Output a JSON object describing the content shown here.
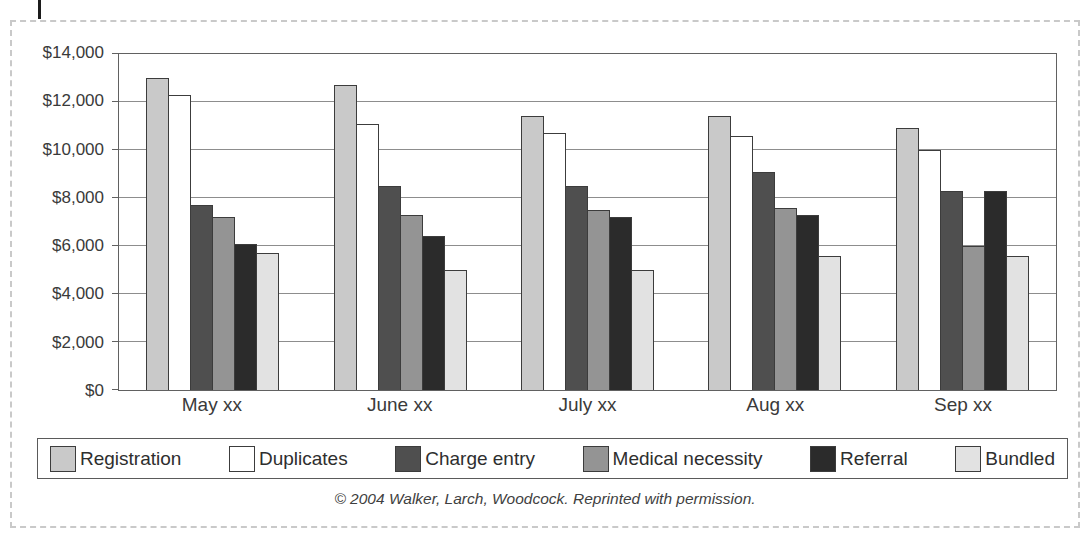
{
  "figure": {
    "caption": "© 2004 Walker, Larch, Woodcock. Reprinted with permission."
  },
  "colors": {
    "panel_border": "#c9c9c9",
    "plot_border": "#616161",
    "gridline": "#8d8d8d",
    "bar_border": "#3c3c3c",
    "text": "#3a3a3a",
    "page_mark": "#1c1c1c"
  },
  "chart_data": {
    "type": "bar",
    "title": "",
    "xlabel": "",
    "ylabel": "",
    "grid": true,
    "legend_position": "bottom",
    "ylim": [
      0,
      14000
    ],
    "ytick_step": 2000,
    "ytick_labels": [
      "$0",
      "$2,000",
      "$4,000",
      "$6,000",
      "$8,000",
      "$10,000",
      "$12,000",
      "$14,000"
    ],
    "categories": [
      "May xx",
      "June xx",
      "July xx",
      "Aug xx",
      "Sep xx"
    ],
    "series": [
      {
        "name": "Registration",
        "color": "#c9c9c9",
        "values": [
          13000,
          12700,
          11400,
          11400,
          10900
        ]
      },
      {
        "name": "Duplicates",
        "color": "#ffffff",
        "values": [
          12300,
          11100,
          10700,
          10600,
          10000
        ]
      },
      {
        "name": "Charge entry",
        "color": "#4f4f4f",
        "values": [
          7700,
          8500,
          8500,
          9100,
          8300
        ]
      },
      {
        "name": "Medical necessity",
        "color": "#949494",
        "values": [
          7200,
          7300,
          7500,
          7600,
          6000
        ]
      },
      {
        "name": "Referral",
        "color": "#2b2b2b",
        "values": [
          6100,
          6400,
          7200,
          7300,
          8300
        ]
      },
      {
        "name": "Bundled",
        "color": "#e2e2e2",
        "values": [
          5700,
          5000,
          5000,
          5600,
          5600
        ]
      }
    ]
  }
}
